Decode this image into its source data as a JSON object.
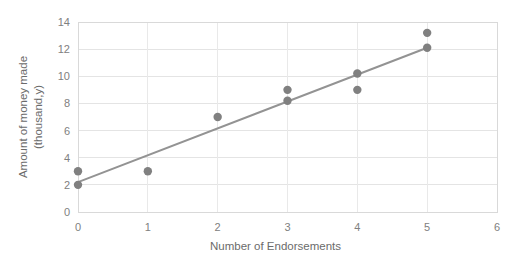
{
  "chart_data": {
    "type": "scatter",
    "title": "",
    "xlabel": "Number of Endorsements",
    "ylabel": "Amount of money made (thousand,y)",
    "ylabel_line1": "Amount of money made",
    "ylabel_line2": "(thousand,y)",
    "xlim": [
      0,
      6
    ],
    "ylim": [
      0,
      14
    ],
    "xticks": [
      0,
      1,
      2,
      3,
      4,
      5,
      6
    ],
    "xtick_labels": [
      "0",
      "1",
      "2",
      "3",
      "4",
      "5",
      "6"
    ],
    "yticks": [
      0,
      2,
      4,
      6,
      8,
      10,
      12,
      14
    ],
    "ytick_labels": [
      "0",
      "2",
      "4",
      "6",
      "8",
      "10",
      "12",
      "14"
    ],
    "grid": "horizontal-and-vertical",
    "legend": "none",
    "point_color": "#808080",
    "line_color": "#939393",
    "grid_color": "#e4e4e4",
    "points": [
      {
        "x": 0,
        "y": 3.0
      },
      {
        "x": 0,
        "y": 2.0
      },
      {
        "x": 1,
        "y": 3.0
      },
      {
        "x": 2,
        "y": 7.0
      },
      {
        "x": 3,
        "y": 9.0
      },
      {
        "x": 3,
        "y": 8.2
      },
      {
        "x": 4,
        "y": 10.2
      },
      {
        "x": 4,
        "y": 9.0
      },
      {
        "x": 5,
        "y": 13.2
      },
      {
        "x": 5,
        "y": 12.1
      }
    ],
    "trendline": {
      "x_start": 0,
      "y_start": 2.2,
      "x_end": 5,
      "y_end": 12.1
    }
  }
}
